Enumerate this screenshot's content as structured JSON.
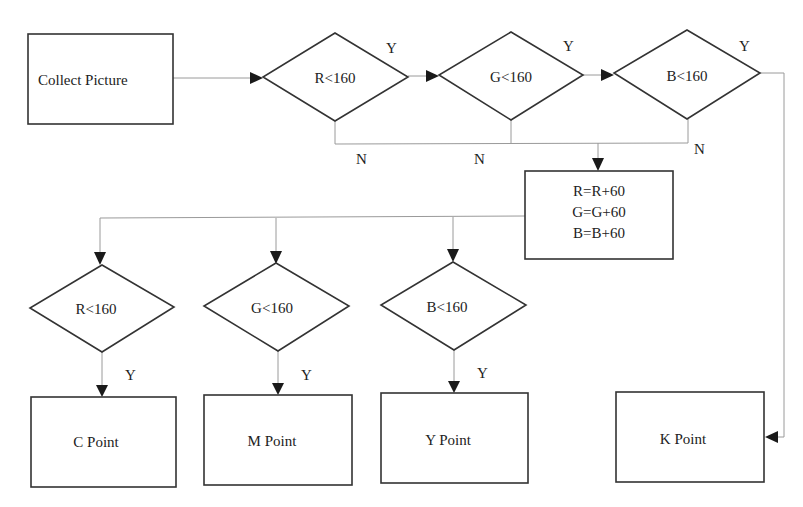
{
  "diagram": {
    "start": {
      "label": "Collect Picture"
    },
    "top_decisions": [
      {
        "label": "R<160",
        "yes": "Y",
        "no": "N"
      },
      {
        "label": "G<160",
        "yes": "Y",
        "no": "N"
      },
      {
        "label": "B<160",
        "yes": "Y",
        "no": "N"
      }
    ],
    "process": {
      "lines": [
        "R=R+60",
        "G=G+60",
        "B=B+60"
      ]
    },
    "bottom_decisions": [
      {
        "label": "R<160",
        "yes": "Y"
      },
      {
        "label": "G<160",
        "yes": "Y"
      },
      {
        "label": "B<160",
        "yes": "Y"
      }
    ],
    "outputs": [
      {
        "label": "C Point"
      },
      {
        "label": "M Point"
      },
      {
        "label": "Y Point"
      },
      {
        "label": "K Point"
      }
    ]
  }
}
